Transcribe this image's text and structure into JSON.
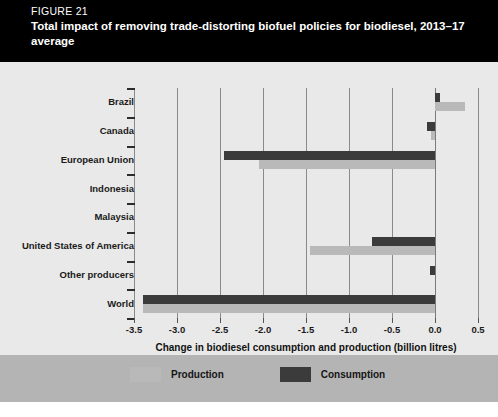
{
  "header": {
    "figure_label": "FIGURE 21",
    "title": "Total impact of removing trade-distorting biofuel policies for biodiesel, 2013–17 average"
  },
  "legend": {
    "production_label": "Production",
    "consumption_label": "Consumption",
    "production_color": "#b9b9b9",
    "consumption_color": "#3b3b3b"
  },
  "colors": {
    "header_background": "#000000",
    "panel_background": "#e9e9e9",
    "legend_background": "#b4b4b4",
    "gridline": "#8a8a8a",
    "axis": "#3a3a3a"
  },
  "chart_data": {
    "type": "bar",
    "orientation": "horizontal",
    "title": "Total impact of removing trade-distorting biofuel policies for biodiesel, 2013–17 average",
    "xlabel": "Change in biodiesel consumption and production (billion litres)",
    "ylabel": "",
    "xlim": [
      -3.5,
      0.5
    ],
    "xticks": [
      "-3.5",
      "-3.0",
      "-2.5",
      "-2.0",
      "-1.5",
      "-1.0",
      "-0.5",
      "0.0",
      "0.5"
    ],
    "xtick_values": [
      -3.5,
      -3.0,
      -2.5,
      -2.0,
      -1.5,
      -1.0,
      -0.5,
      0.0,
      0.5
    ],
    "grid": true,
    "legend_position": "bottom",
    "categories": [
      "Brazil",
      "Canada",
      "European Union",
      "Indonesia",
      "Malaysia",
      "United States of America",
      "Other producers",
      "World"
    ],
    "series": [
      {
        "name": "Consumption",
        "color": "#3b3b3b",
        "values": [
          0.06,
          -0.09,
          -2.45,
          0.0,
          0.0,
          -0.73,
          -0.06,
          -3.4
        ]
      },
      {
        "name": "Production",
        "color": "#b9b9b9",
        "values": [
          0.35,
          -0.05,
          -2.05,
          0.0,
          0.0,
          -1.45,
          0.0,
          -3.4
        ]
      }
    ]
  }
}
